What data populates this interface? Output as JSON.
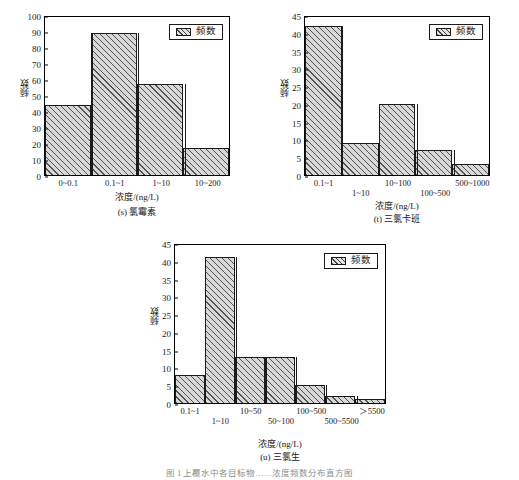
{
  "figure": {
    "caption": "图 1   上覆水中各目标物……浓度频数分布直方图"
  },
  "legend_label": "频数",
  "y_axis_label": "频数",
  "x_axis_label": "浓度/(ng/L)",
  "chart_data": [
    {
      "type": "bar",
      "panel_id": "s",
      "title": "(s) 氯霉素",
      "categories": [
        "0~0.1",
        "0.1~1",
        "1~10",
        "10~200"
      ],
      "values": [
        44,
        89,
        57,
        17
      ],
      "legend": [
        "频数"
      ],
      "xlabel": "浓度/(ng/L)",
      "ylabel": "频数",
      "ylim": [
        0,
        100
      ],
      "yticks": [
        0,
        10,
        20,
        30,
        40,
        50,
        60,
        70,
        80,
        90,
        100
      ],
      "grid": false,
      "legend_position": "top-right",
      "label_stagger": false
    },
    {
      "type": "bar",
      "panel_id": "t",
      "title": "(t) 三氯卡班",
      "categories": [
        "0.1~1",
        "1~10",
        "10~100",
        "100~500",
        "500~1000"
      ],
      "values": [
        42,
        9,
        20,
        7,
        3
      ],
      "legend": [
        "频数"
      ],
      "xlabel": "浓度/(ng/L)",
      "ylabel": "频数",
      "ylim": [
        0,
        45
      ],
      "yticks": [
        0,
        5,
        10,
        15,
        20,
        25,
        30,
        35,
        40,
        45
      ],
      "grid": false,
      "legend_position": "top-right",
      "label_stagger": true
    },
    {
      "type": "bar",
      "panel_id": "u",
      "title": "(u) 三氯生",
      "categories": [
        "0.1~1",
        "1~10",
        "10~50",
        "50~100",
        "100~500",
        "500~5500",
        "＞5500"
      ],
      "values": [
        8,
        41,
        13,
        13,
        5,
        2,
        1
      ],
      "legend": [
        "频数"
      ],
      "xlabel": "浓度/(ng/L)",
      "ylabel": "频数",
      "ylim": [
        0,
        45
      ],
      "yticks": [
        0,
        5,
        10,
        15,
        20,
        25,
        30,
        35,
        40,
        45
      ],
      "grid": false,
      "legend_position": "top-right",
      "label_stagger": true
    }
  ]
}
